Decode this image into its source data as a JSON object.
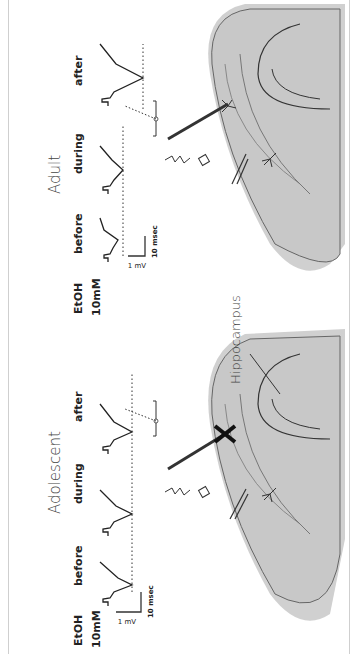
{
  "figure": {
    "orientation": "rotated 90 degrees counter-clockwise",
    "panels": [
      {
        "id": "adolescent",
        "title": "Adolescent",
        "treatment_label_line1": "EtOH",
        "treatment_label_line2": "10mM",
        "conditions": [
          "before",
          "during",
          "after"
        ],
        "scale_bar": {
          "voltage": "1 mV",
          "time": "10 msec"
        },
        "blocked_marker": "X"
      },
      {
        "id": "adult",
        "title": "Adult",
        "treatment_label_line1": "EtOH",
        "treatment_label_line2": "10mM",
        "conditions": [
          "before",
          "during",
          "after"
        ],
        "scale_bar": {
          "voltage": "1 mV",
          "time": "10 msec"
        }
      }
    ],
    "region_label": "Hippocampus",
    "colors": {
      "tissue_fill": "#c8c8c8",
      "tissue_edge": "#a9a9a9",
      "trace": "#222222",
      "frame": "#cfcfcf"
    }
  }
}
